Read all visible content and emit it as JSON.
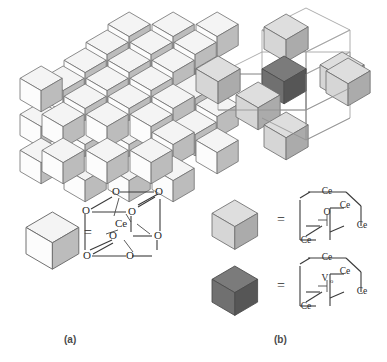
{
  "figure": {
    "title_panels": [
      {
        "id": "a",
        "label": "(a)"
      },
      {
        "id": "b",
        "label": "(b)"
      }
    ],
    "equals_symbol": "=",
    "colors": {
      "cube_light_top": "#f3f3f3",
      "cube_light_front": "#fbfbfb",
      "cube_light_side": "#b9b9b9",
      "cube_gray_top": "#dcdcdc",
      "cube_gray_front": "#d4d4d4",
      "cube_gray_side": "#a9a9a9",
      "cube_dark_top": "#787878",
      "cube_dark_front": "#6e6e6e",
      "cube_dark_side": "#555555",
      "outline": "#6b6b6b",
      "wireframe": "#9a9a9a",
      "bond": "#3a3a3a",
      "text": "#2b2b2b",
      "label": "#4a4a4a",
      "background": "#ffffff"
    }
  },
  "panel_a": {
    "label": "(a)",
    "description": "three-dimensional checkerboard stack of cubes representing bulk ceria lattice",
    "legend": {
      "cube_shade": "light",
      "equals": "=",
      "center_atom": "Ce",
      "vertex_atoms": [
        "O",
        "O",
        "O",
        "O",
        "O",
        "O",
        "O",
        "O"
      ],
      "vertex_count": 8,
      "center_label": "Ce",
      "vertex_label": "O"
    }
  },
  "panel_b": {
    "label": "(b)",
    "description": "cross shaped cluster of six light cubes around one dark central cube, with wireframe outlines",
    "legend_items": [
      {
        "cube_shade": "light-gray",
        "equals": "=",
        "center_atom": "O",
        "center_atom_subscript": "",
        "vertex_atoms": [
          "Ce",
          "Ce",
          "Ce",
          "Ce",
          "Ce",
          "Ce",
          "Ce",
          "Ce"
        ],
        "vertex_label": "Ce"
      },
      {
        "cube_shade": "dark-gray",
        "equals": "=",
        "center_atom": "V",
        "center_atom_subscript": "o",
        "vertex_atoms": [
          "Ce",
          "Ce",
          "Ce",
          "Ce",
          "Ce",
          "Ce",
          "Ce",
          "Ce"
        ],
        "vertex_label": "Ce"
      }
    ]
  }
}
